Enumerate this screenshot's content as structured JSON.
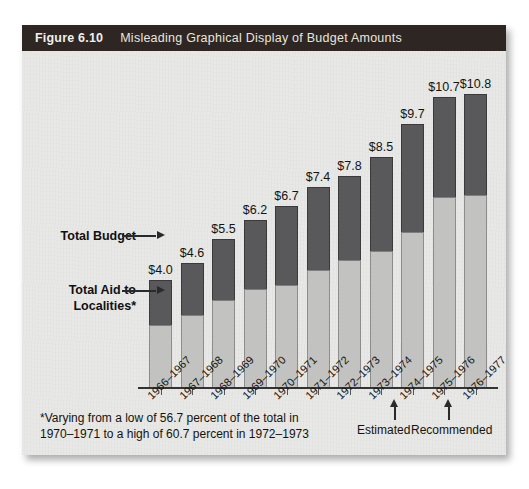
{
  "figure": {
    "number": "Figure 6.10",
    "title": "Misleading Graphical Display of Budget Amounts"
  },
  "callouts": {
    "total_budget": "Total Budget",
    "total_aid_line1": "Total Aid to",
    "total_aid_line2": "Localities*"
  },
  "annotations": {
    "estimated": "Estimated",
    "recommended": "Recommended"
  },
  "footnote": "*Varying from a low of 56.7 percent of the total in\n1970–1971 to a high of 60.7 percent in 1972–1973",
  "colors": {
    "header_bg": "#2e2622",
    "panel_bg": "#e8e8e6",
    "bar_top": "#59585a",
    "bar_bottom": "#c2c2c0"
  },
  "chart_data": {
    "type": "bar",
    "stacked": true,
    "title": "Misleading Graphical Display of Budget Amounts",
    "xlabel": "",
    "ylabel": "",
    "grid": false,
    "legend_position": "callout-left",
    "axis_note": "Vertical scale suppressed — no y-axis or tick values are shown, which is what makes the display misleading.",
    "value_prefix": "$",
    "categories": [
      "1966–1967",
      "1967–1968",
      "1968–1969",
      "1969–1970",
      "1970–1971",
      "1971–1972",
      "1972–1973",
      "1973–1974",
      "1974–1975",
      "1975–1976",
      "1976–1977"
    ],
    "values": [
      4.0,
      4.6,
      5.5,
      6.2,
      6.7,
      7.4,
      7.8,
      8.5,
      9.7,
      10.7,
      10.8
    ],
    "value_labels": [
      "$4.0",
      "$4.6",
      "$5.5",
      "$6.2",
      "$6.7",
      "$7.4",
      "$7.8",
      "$8.5",
      "$9.7",
      "$10.7",
      "$10.8"
    ],
    "series": [
      {
        "name": "Total Aid to Localities*",
        "color": "#c2c2c0",
        "values": [
          2.35,
          2.7,
          3.25,
          3.65,
          3.8,
          4.35,
          4.74,
          5.05,
          5.75,
          7.05,
          7.1
        ]
      },
      {
        "name": "Remainder of Total Budget",
        "color": "#59585a",
        "values": [
          1.65,
          1.9,
          2.25,
          2.55,
          2.9,
          3.05,
          3.06,
          3.45,
          3.95,
          3.65,
          3.7
        ]
      }
    ],
    "annotated_categories": [
      {
        "category": "1975–1976",
        "note": "Estimated"
      },
      {
        "category": "1976–1977",
        "note": "Recommended"
      }
    ],
    "footnote": "*Varying from a low of 56.7 percent of the total in 1970–1971 to a high of 60.7 percent in 1972–1973"
  }
}
